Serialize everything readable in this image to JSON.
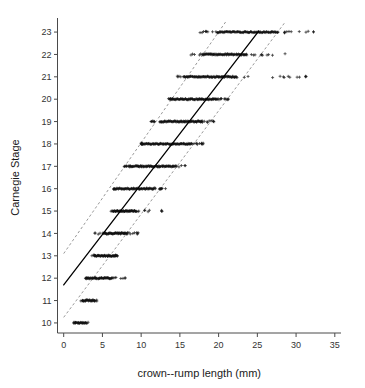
{
  "chart_data": {
    "type": "scatter",
    "title": "",
    "xlabel": "crown--rump length (mm)",
    "ylabel": "Carnegie Stage",
    "xlim": [
      -0.8,
      35.8
    ],
    "ylim": [
      9.55,
      23.45
    ],
    "grid": false,
    "legend": "none",
    "xticks": [
      0,
      5,
      10,
      15,
      20,
      25,
      30,
      35
    ],
    "xtick_labels": [
      "0",
      "5",
      "10",
      "15",
      "20",
      "25",
      "30",
      "35"
    ],
    "yticks": [
      10,
      11,
      12,
      13,
      14,
      15,
      16,
      17,
      18,
      19,
      20,
      21,
      22,
      23
    ],
    "ytick_labels": [
      "10",
      "11",
      "12",
      "13",
      "14",
      "15",
      "16",
      "17",
      "18",
      "19",
      "20",
      "21",
      "22",
      "23"
    ],
    "point_marker": "+",
    "point_color": "#111111",
    "series": [
      {
        "name": "observations",
        "description": "crown-rump length measurements grouped by Carnegie Stage; points jittered horizontally within each stage",
        "stage_bands": [
          {
            "stage": 10,
            "core_min": 1.5,
            "core_max": 3.0,
            "whisker_min": 1.3,
            "whisker_max": 3.4,
            "n": 26
          },
          {
            "stage": 11,
            "core_min": 2.4,
            "core_max": 4.0,
            "whisker_min": 2.1,
            "whisker_max": 4.3,
            "n": 28
          },
          {
            "stage": 12,
            "core_min": 3.0,
            "core_max": 6.2,
            "whisker_min": 2.8,
            "whisker_max": 8.0,
            "n": 54
          },
          {
            "stage": 13,
            "core_min": 4.0,
            "core_max": 6.7,
            "whisker_min": 3.6,
            "whisker_max": 7.1,
            "n": 50
          },
          {
            "stage": 14,
            "core_min": 5.1,
            "core_max": 8.2,
            "whisker_min": 4.0,
            "whisker_max": 9.9,
            "n": 58
          },
          {
            "stage": 15,
            "core_min": 6.4,
            "core_max": 9.4,
            "whisker_min": 6.1,
            "whisker_max": 13.0,
            "n": 56
          },
          {
            "stage": 16,
            "core_min": 6.6,
            "core_max": 11.6,
            "whisker_min": 6.4,
            "whisker_max": 13.2,
            "n": 70
          },
          {
            "stage": 17,
            "core_min": 8.6,
            "core_max": 14.2,
            "whisker_min": 7.8,
            "whisker_max": 15.8,
            "n": 84
          },
          {
            "stage": 18,
            "core_min": 10.2,
            "core_max": 16.5,
            "whisker_min": 10.0,
            "whisker_max": 18.2,
            "n": 88
          },
          {
            "stage": 19,
            "core_min": 12.4,
            "core_max": 17.8,
            "whisker_min": 11.2,
            "whisker_max": 19.4,
            "n": 82
          },
          {
            "stage": 20,
            "core_min": 14.0,
            "core_max": 19.8,
            "whisker_min": 13.5,
            "whisker_max": 21.4,
            "n": 86
          },
          {
            "stage": 21,
            "core_min": 15.6,
            "core_max": 22.3,
            "whisker_min": 14.6,
            "whisker_max": 34.2,
            "n": 92
          },
          {
            "stage": 22,
            "core_min": 18.0,
            "core_max": 23.6,
            "whisker_min": 16.0,
            "whisker_max": 28.6,
            "n": 80
          },
          {
            "stage": 23,
            "core_min": 19.8,
            "core_max": 27.6,
            "whisker_min": 17.4,
            "whisker_max": 33.2,
            "n": 96
          }
        ]
      }
    ],
    "fit_line": {
      "name": "regression line",
      "style": "solid",
      "color": "#000000",
      "x_start": 0.0,
      "y_start": 11.7,
      "x_end": 25.2,
      "y_end": 23.05
    },
    "prediction_bands": [
      {
        "name": "upper prediction limit",
        "style": "dashed",
        "color": "#8c8c8c",
        "x_start": 0.0,
        "y_start": 13.1,
        "x_end": 20.9,
        "y_end": 23.45
      },
      {
        "name": "lower prediction limit",
        "style": "dashed",
        "color": "#8c8c8c",
        "x_start": 0.0,
        "y_start": 10.25,
        "x_end": 28.6,
        "y_end": 23.45
      }
    ]
  },
  "axes": {
    "x_title": "crown--rump length (mm)",
    "y_title": "Carnegie Stage"
  }
}
